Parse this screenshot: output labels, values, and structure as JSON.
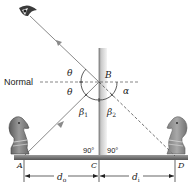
{
  "diagram": {
    "labels": {
      "normal": "Normal",
      "point_a": "A",
      "point_b": "B",
      "point_c": "C",
      "point_d": "D",
      "theta_upper": "θ",
      "theta_lower": "θ",
      "alpha": "α",
      "beta1": "β",
      "beta1_sub": "1",
      "beta2": "β",
      "beta2_sub": "2",
      "angle_left": "90°",
      "angle_right": "90°",
      "object_distance": "d",
      "object_distance_sub": "o",
      "image_distance": "d",
      "image_distance_sub": "i"
    },
    "icons": {
      "eye": "eye-icon",
      "object": "chess-knight-icon",
      "image": "chess-knight-image-icon"
    },
    "colors": {
      "ray": "#8a8a8a",
      "mirror_light": "#e6e6e6",
      "mirror_dark": "#9a9a9a",
      "base": "#6e6e6e",
      "text": "#222222",
      "knight": "#7a7a7a"
    }
  }
}
